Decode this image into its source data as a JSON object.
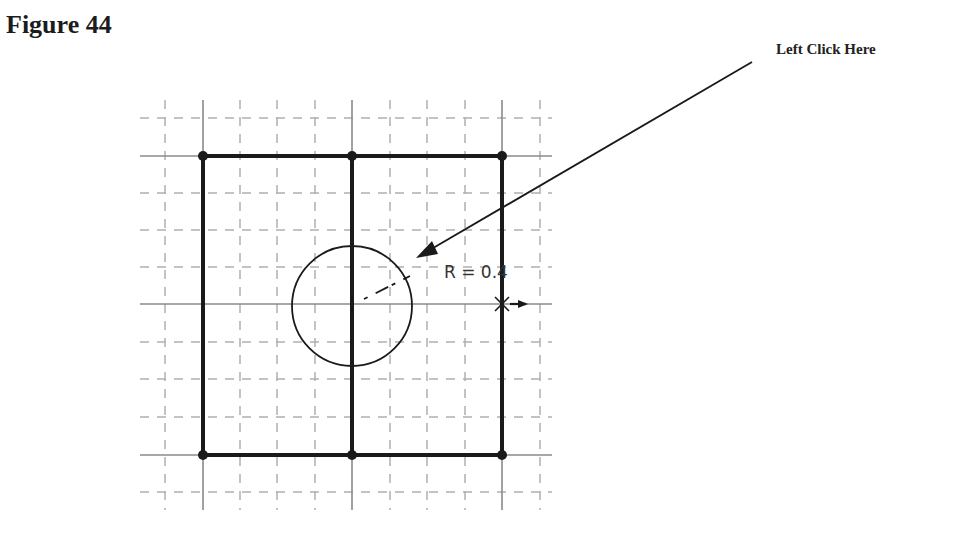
{
  "figure": {
    "title": "Figure 44",
    "callout_label": "Left Click Here",
    "dimension_label": "R = 0.4"
  },
  "grid": {
    "solid_x": [
      203,
      352,
      502
    ],
    "solid_y": [
      156,
      304,
      455
    ],
    "dashed_x": [
      165,
      240,
      277,
      315,
      390,
      427,
      465,
      540
    ],
    "dashed_y": [
      118,
      193,
      230,
      267,
      342,
      379,
      417,
      492
    ]
  },
  "circle": {
    "cx": 352,
    "cy": 306,
    "r": 60
  },
  "colors": {
    "ink": "#1a1a1a",
    "grid_solid": "#8a8a8a",
    "grid_dashed": "#b0b0b0"
  }
}
